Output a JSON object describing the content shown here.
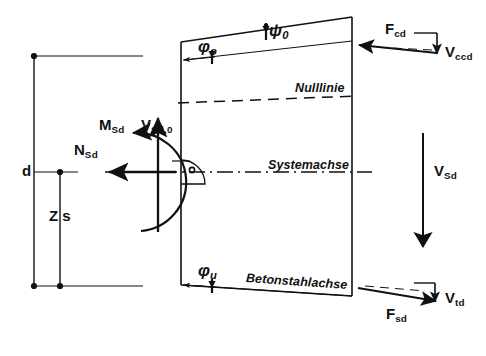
{
  "figure": {
    "kind": "structural-mechanics-free-body-diagram",
    "language": "de",
    "background_color": "#ffffff",
    "line_color": "#111111",
    "width": 486,
    "height": 356
  },
  "labels": {
    "d": "d",
    "zs": "Z s",
    "M_Sd": {
      "base": "M",
      "sub": "Sd"
    },
    "N_Sd": {
      "base": "N",
      "sub": "Sd"
    },
    "V_Sd0": {
      "base": "V",
      "sub": "Sd,0"
    },
    "V_Sd": {
      "base": "V",
      "sub": "Sd"
    },
    "F_cd": {
      "base": "F",
      "sub": "cd"
    },
    "V_ccd": {
      "base": "V",
      "sub": "ccd"
    },
    "F_sd": {
      "base": "F",
      "sub": "sd"
    },
    "V_td": {
      "base": "V",
      "sub": "td"
    },
    "phi_o": {
      "base": "φ",
      "sub": "o"
    },
    "phi_u": {
      "base": "φ",
      "sub": "u"
    },
    "psi_o": {
      "base": "ψ",
      "sub": "0"
    },
    "nulllinie": "Nulllinie",
    "systemachse": "Systemachse",
    "betonstahlachse": "Betonstahlachse"
  },
  "geometry": {
    "trapezoid": {
      "top_left": [
        181,
        42
      ],
      "top_right": [
        352,
        17
      ],
      "bottom_right": [
        352,
        296
      ],
      "bottom_left": [
        181,
        285
      ]
    },
    "system_axis_y": 172,
    "neutral_axis": {
      "left": [
        181,
        103
      ],
      "right": [
        352,
        96
      ]
    },
    "rebar_axis": {
      "left": [
        181,
        285
      ],
      "right": [
        352,
        296
      ]
    },
    "upper_chord": {
      "left": [
        181,
        60
      ],
      "right": [
        352,
        40
      ]
    },
    "dimension_d": {
      "x": 34,
      "y_top": 56,
      "y_bottom": 286
    },
    "dimension_zs": {
      "x": 60,
      "y_top": 172,
      "y_bottom": 286
    }
  },
  "forces": [
    {
      "name": "N_Sd",
      "direction": "left",
      "from": [
        175,
        172
      ],
      "to": [
        110,
        172
      ]
    },
    {
      "name": "V_Sd0",
      "direction": "up",
      "from": [
        158,
        230
      ],
      "to": [
        158,
        118
      ]
    },
    {
      "name": "M_Sd",
      "direction": "counterclockwise-arc",
      "center": [
        150,
        175
      ]
    },
    {
      "name": "V_Sd",
      "direction": "down",
      "from": [
        423,
        135
      ],
      "to": [
        423,
        245
      ]
    },
    {
      "name": "F_cd",
      "direction": "left",
      "from": [
        437,
        53
      ],
      "to": [
        358,
        45
      ]
    },
    {
      "name": "V_ccd",
      "direction": "down",
      "from": [
        437,
        33
      ],
      "to": [
        437,
        52
      ]
    },
    {
      "name": "F_sd",
      "direction": "right-down",
      "from": [
        358,
        287
      ],
      "to": [
        435,
        300
      ]
    },
    {
      "name": "V_td",
      "direction": "down",
      "from": [
        435,
        283
      ],
      "to": [
        435,
        301
      ]
    }
  ]
}
